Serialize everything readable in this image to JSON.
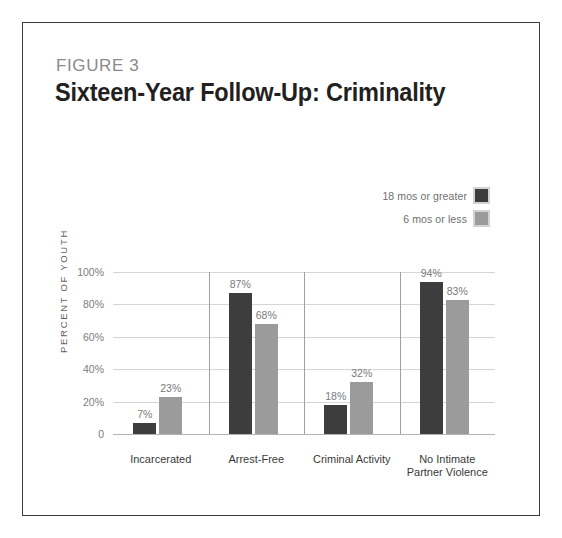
{
  "figure": {
    "label": "FIGURE 3",
    "title": "Sixteen-Year Follow-Up: Criminality"
  },
  "legend": {
    "position": "top-right",
    "items": [
      {
        "label": "18 mos or greater",
        "color": "#3d3d3d"
      },
      {
        "label": "6 mos or less",
        "color": "#9b9b9b"
      }
    ]
  },
  "colors": {
    "series_dark": "#3d3d3d",
    "series_light": "#9b9b9b",
    "gridline": "#d6d6d6",
    "separator": "#a0a0a0",
    "frame": "#3c3c3c",
    "title_text": "#231f20",
    "label_text": "#7a7a7a"
  },
  "chart_data": {
    "type": "bar",
    "title": "Sixteen-Year Follow-Up: Criminality",
    "subtitle": "FIGURE 3",
    "xlabel": "",
    "ylabel": "PERCENT OF YOUTH",
    "ylim": [
      0,
      100
    ],
    "yticks": [
      "0",
      "20%",
      "40%",
      "60%",
      "80%",
      "100%"
    ],
    "ytick_values": [
      0,
      20,
      40,
      60,
      80,
      100
    ],
    "grid": true,
    "legend_position": "top-right",
    "categories": [
      "Incarcerated",
      "Arrest-Free",
      "Criminal Activity",
      "No Intimate Partner Violence"
    ],
    "category_lines": [
      [
        "Incarcerated"
      ],
      [
        "Arrest-Free"
      ],
      [
        "Criminal Activity"
      ],
      [
        "No Intimate",
        "Partner Violence"
      ]
    ],
    "series": [
      {
        "name": "18 mos or greater",
        "color": "#3d3d3d",
        "values": [
          7,
          87,
          18,
          94
        ],
        "labels": [
          "7%",
          "87%",
          "18%",
          "94%"
        ]
      },
      {
        "name": "6 mos or less",
        "color": "#9b9b9b",
        "values": [
          23,
          68,
          32,
          83
        ],
        "labels": [
          "23%",
          "68%",
          "32%",
          "83%"
        ]
      }
    ]
  }
}
